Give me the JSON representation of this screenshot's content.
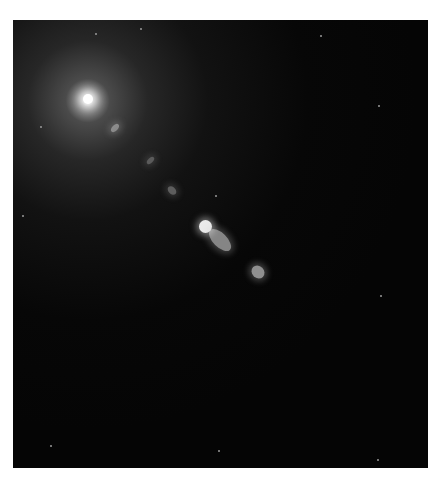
{
  "image": {
    "subject": "elliptical galaxy core with relativistic jet",
    "background_color": "#050505",
    "frame_color": "#ffffff",
    "core_position": [
      88,
      102
    ],
    "jet_direction": "down-right",
    "knots": [
      {
        "x": 115,
        "y": 128,
        "w": 6,
        "h": 10,
        "opacity": 0.45
      },
      {
        "x": 150,
        "y": 160,
        "w": 5,
        "h": 9,
        "opacity": 0.3
      },
      {
        "x": 172,
        "y": 190,
        "w": 10,
        "h": 7,
        "opacity": 0.35
      },
      {
        "x": 205,
        "y": 226,
        "w": 13,
        "h": 13,
        "opacity": 1.0
      },
      {
        "x": 220,
        "y": 240,
        "w": 28,
        "h": 14,
        "opacity": 0.55
      },
      {
        "x": 258,
        "y": 272,
        "w": 14,
        "h": 12,
        "opacity": 0.6
      }
    ],
    "stars": [
      [
        95,
        33
      ],
      [
        140,
        28
      ],
      [
        40,
        126
      ],
      [
        22,
        215
      ],
      [
        378,
        105
      ],
      [
        215,
        195
      ],
      [
        50,
        445
      ],
      [
        218,
        450
      ],
      [
        377,
        459
      ],
      [
        380,
        295
      ],
      [
        320,
        35
      ]
    ]
  }
}
